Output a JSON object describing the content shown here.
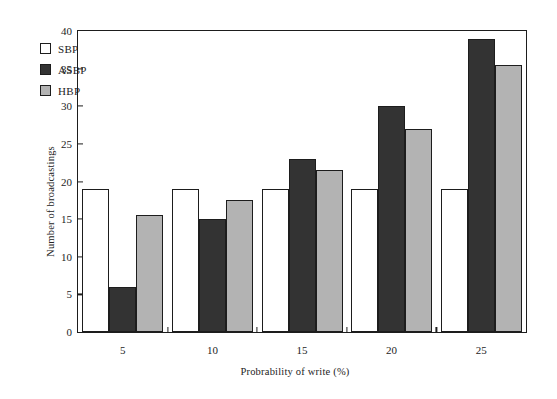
{
  "chart_data": {
    "type": "bar",
    "title": "",
    "subtitle": "",
    "xlabel": "Probrability of write (%)",
    "ylabel": "Number of broadcastings",
    "categories": [
      "5",
      "10",
      "15",
      "20",
      "25"
    ],
    "series": [
      {
        "name": "SBP",
        "color": "#ffffff",
        "values": [
          19,
          19,
          19,
          19,
          19
        ]
      },
      {
        "name": "ASBP",
        "color": "#333333",
        "values": [
          6,
          15,
          23,
          30,
          39
        ]
      },
      {
        "name": "HBP",
        "color": "#b3b3b3",
        "values": [
          15.5,
          17.5,
          21.5,
          27,
          35.5
        ]
      }
    ],
    "ylim": [
      0,
      40
    ],
    "ytick_labels": [
      "0",
      "5",
      "10",
      "15",
      "20",
      "25",
      "30",
      "35",
      "40"
    ],
    "ytick_values": [
      0,
      5,
      10,
      15,
      20,
      25,
      30,
      35,
      40
    ],
    "grid": false,
    "legend_position": "top-left",
    "frame": "box"
  }
}
